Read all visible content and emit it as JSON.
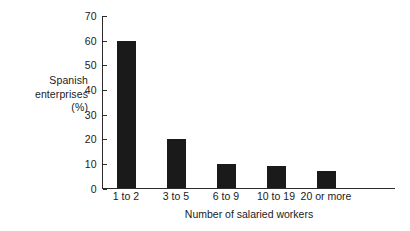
{
  "chart_data": {
    "type": "bar",
    "title": "",
    "subtitle": "",
    "categories": [
      "1 to 2",
      "3 to 5",
      "6 to 9",
      "10 to 19",
      "20 or more"
    ],
    "values": [
      60,
      20,
      10,
      9,
      7
    ],
    "series": [
      {
        "name": "Spanish enterprises (%)",
        "values": [
          60,
          20,
          10,
          9,
          7
        ]
      }
    ],
    "xlabel": "Number of salaried workers",
    "ylabel": "Spanish enterprises (%)",
    "ylabel_lines": [
      "Spanish",
      "enterprises",
      "(%)"
    ],
    "ylim": [
      0,
      70
    ],
    "ytick_values": [
      0,
      10,
      20,
      30,
      40,
      50,
      60,
      70
    ],
    "ytick_labels": [
      "0",
      "10",
      "20",
      "30",
      "40",
      "50",
      "60",
      "70"
    ],
    "grid": false,
    "legend": false,
    "legend_position": "none",
    "bar_color": "#1a1a1a",
    "axis_color": "#2b2b2b",
    "background_color": "#ffffff"
  }
}
